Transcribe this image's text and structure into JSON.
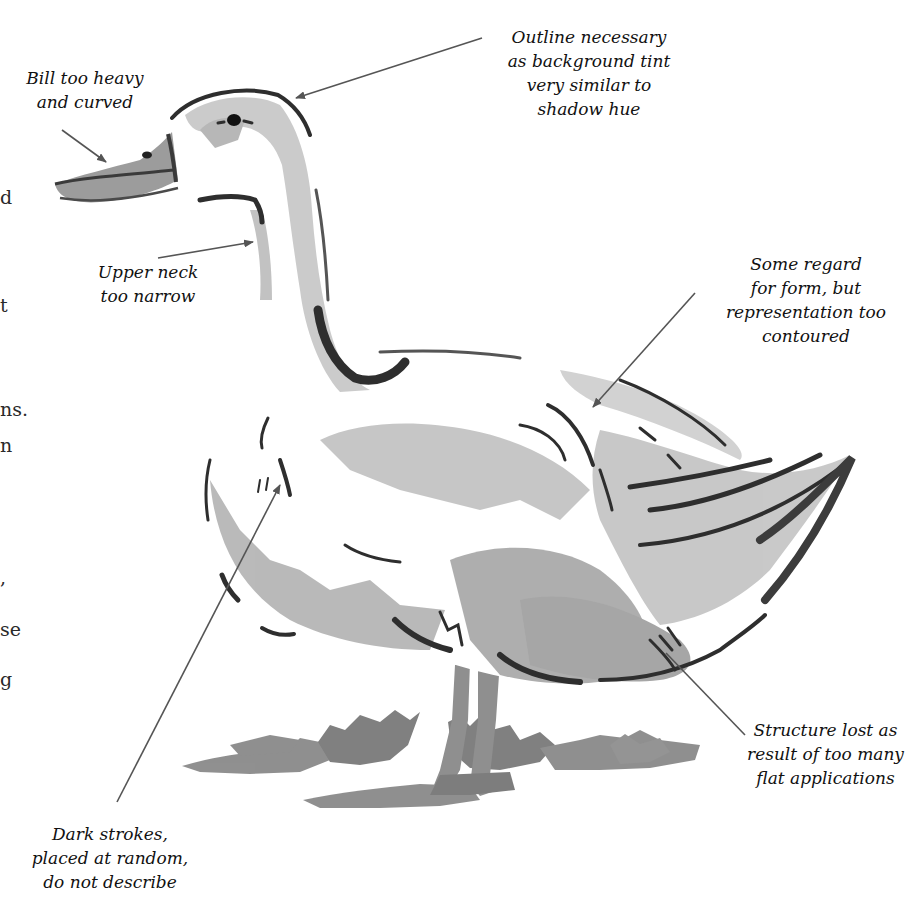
{
  "page": {
    "background": "#ffffff",
    "ink_dark": "#2b2b2b",
    "ink_mid": "#8c8c8c",
    "ink_light": "#bdbdbd"
  },
  "body_text_fragments": [
    {
      "text": "d",
      "x": 0,
      "y": 188
    },
    {
      "text": "t",
      "x": 0,
      "y": 296
    },
    {
      "text": "ns.",
      "x": 0,
      "y": 400
    },
    {
      "text": "n",
      "x": 0,
      "y": 436
    },
    {
      "text": ",",
      "x": 0,
      "y": 568
    },
    {
      "text": "se",
      "x": 0,
      "y": 620
    },
    {
      "text": "g",
      "x": 0,
      "y": 670
    }
  ],
  "illustration": {
    "subject": "duck",
    "annotations": [
      {
        "id": "bill",
        "lines": [
          "Bill too heavy",
          "and curved"
        ]
      },
      {
        "id": "outline",
        "lines": [
          "Outline necessary",
          "as background tint",
          "very similar to",
          "shadow hue"
        ]
      },
      {
        "id": "neck",
        "lines": [
          "Upper neck",
          "too narrow"
        ]
      },
      {
        "id": "form",
        "lines": [
          "Some regard",
          "for form, but",
          "representation too",
          "contoured"
        ]
      },
      {
        "id": "structure",
        "lines": [
          "Structure lost as",
          "result of too many",
          "flat applications"
        ]
      },
      {
        "id": "strokes",
        "lines": [
          "Dark strokes,",
          "placed at random,",
          "do not describe"
        ]
      }
    ]
  }
}
